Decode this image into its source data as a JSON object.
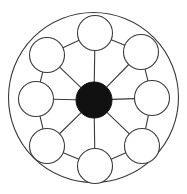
{
  "diagram": {
    "type": "hub-and-spoke-wheel",
    "canvas": {
      "width": 187,
      "height": 194,
      "background": "#ffffff"
    },
    "colors": {
      "stroke": "#3a3a3a",
      "node_fill": "#ffffff",
      "hub_fill": "#111111",
      "background": "#ffffff"
    },
    "outer_ring": {
      "label": "outer boundary circle",
      "cx": 93.5,
      "cy": 97.5,
      "r": 85,
      "stroke_width": 1.1
    },
    "hub": {
      "label": "central hub node",
      "cx": 94,
      "cy": 100,
      "r": 18,
      "filled": true
    },
    "node_radius": 17.5,
    "node_orbit_radius": 67,
    "node_count": 8,
    "spoke_count": 8,
    "chord_count": 8,
    "nodes": [
      {
        "id": "n1",
        "label": "top",
        "angle_deg": -90,
        "cx": 95,
        "cy": 33
      },
      {
        "id": "n2",
        "label": "upper-right",
        "angle_deg": -45,
        "cx": 141,
        "cy": 52
      },
      {
        "id": "n3",
        "label": "right",
        "angle_deg": 0,
        "cx": 152,
        "cy": 98
      },
      {
        "id": "n4",
        "label": "lower-right",
        "angle_deg": 45,
        "cx": 142,
        "cy": 146
      },
      {
        "id": "n5",
        "label": "bottom",
        "angle_deg": 90,
        "cx": 95,
        "cy": 166
      },
      {
        "id": "n6",
        "label": "lower-left",
        "angle_deg": 135,
        "cx": 47,
        "cy": 146
      },
      {
        "id": "n7",
        "label": "left",
        "angle_deg": 180,
        "cx": 36,
        "cy": 99
      },
      {
        "id": "n8",
        "label": "upper-left",
        "angle_deg": -135,
        "cx": 47,
        "cy": 55
      }
    ],
    "spokes": [
      {
        "from": "hub",
        "to": "n1"
      },
      {
        "from": "hub",
        "to": "n2"
      },
      {
        "from": "hub",
        "to": "n3"
      },
      {
        "from": "hub",
        "to": "n4"
      },
      {
        "from": "hub",
        "to": "n5"
      },
      {
        "from": "hub",
        "to": "n6"
      },
      {
        "from": "hub",
        "to": "n7"
      },
      {
        "from": "hub",
        "to": "n8"
      }
    ],
    "chords": [
      {
        "from": "n1",
        "to": "n2"
      },
      {
        "from": "n2",
        "to": "n3"
      },
      {
        "from": "n3",
        "to": "n4"
      },
      {
        "from": "n4",
        "to": "n5"
      },
      {
        "from": "n5",
        "to": "n6"
      },
      {
        "from": "n6",
        "to": "n7"
      },
      {
        "from": "n7",
        "to": "n8"
      },
      {
        "from": "n8",
        "to": "n1"
      }
    ]
  }
}
